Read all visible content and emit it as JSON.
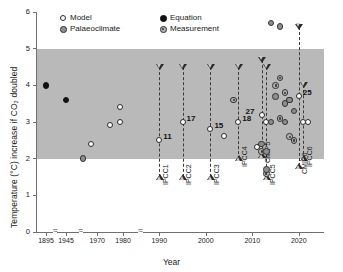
{
  "chart_data": {
    "type": "scatter",
    "title": "",
    "xlabel": "Year",
    "ylabel": "Temperature (°C) increase if CO₂ doubled",
    "ylim": [
      0,
      6
    ],
    "yticks": [
      0,
      1,
      2,
      3,
      4,
      5,
      6
    ],
    "xticks": [
      "1895",
      "1945",
      "1970",
      "1980",
      "1990",
      "2000",
      "2010",
      "2020"
    ],
    "axis_breaks": 3,
    "grid": false,
    "likely_range_band": {
      "low": 2.0,
      "high": 5.0,
      "label": ""
    },
    "legend": {
      "position": "top-left",
      "entries": [
        {
          "key": "model",
          "label": "Model"
        },
        {
          "key": "equation",
          "label": "Equation"
        },
        {
          "key": "palaeoclimate",
          "label": "Palaeoclimate"
        },
        {
          "key": "measurement",
          "label": "Measurement"
        }
      ]
    },
    "assessments": [
      {
        "name": "IPCC1",
        "year": 1990,
        "low": 1.5,
        "high": 4.5,
        "best": 2.5,
        "count": "11"
      },
      {
        "name": "IPCC2",
        "year": 1995,
        "low": 1.5,
        "high": 4.5,
        "best": 3.0,
        "count": "17"
      },
      {
        "name": "IPCC3",
        "year": 2001,
        "low": 1.5,
        "high": 4.5,
        "best": 2.8,
        "count": "15"
      },
      {
        "name": "IPCC4",
        "year": 2007,
        "low": 2.0,
        "high": 4.5,
        "best": 3.0,
        "count": "18"
      },
      {
        "name": "IPCC5",
        "year": 2013,
        "low": 1.5,
        "high": 4.5,
        "best": 3.0,
        "count": ""
      },
      {
        "name": "CMIP5",
        "year": 2012,
        "low": 2.1,
        "high": 4.7,
        "best": 3.2,
        "count": "27"
      },
      {
        "name": "IPCC6",
        "year": 2021,
        "low": 2.0,
        "high": 4.0,
        "best": 3.0,
        "count": ""
      },
      {
        "name": "CMIP6",
        "year": 2020,
        "low": 1.8,
        "high": 5.6,
        "best": 3.7,
        "count": "25"
      }
    ],
    "points": [
      {
        "type": "equation",
        "year": 1895,
        "value": 4.0
      },
      {
        "type": "equation",
        "year": 1945,
        "value": 3.6
      },
      {
        "type": "palaeoclimate",
        "year": 1960,
        "value": 2.0
      },
      {
        "type": "model",
        "year": 1967,
        "value": 2.4
      },
      {
        "type": "model",
        "year": 1975,
        "value": 2.9
      },
      {
        "type": "model",
        "year": 1979,
        "value": 3.0
      },
      {
        "type": "model",
        "year": 1979,
        "value": 3.4
      },
      {
        "type": "model",
        "year": 2004,
        "value": 2.6
      },
      {
        "type": "measurement",
        "year": 2006,
        "value": 3.6
      },
      {
        "type": "model",
        "year": 2011,
        "value": 2.3
      },
      {
        "type": "palaeoclimate",
        "year": 2012,
        "value": 2.4
      },
      {
        "type": "measurement",
        "year": 2012,
        "value": 2.2
      },
      {
        "type": "palaeoclimate",
        "year": 2013,
        "value": 2.2
      },
      {
        "type": "palaeoclimate",
        "year": 2014,
        "value": 5.7
      },
      {
        "type": "palaeoclimate",
        "year": 2016,
        "value": 5.6
      },
      {
        "type": "measurement",
        "year": 2015,
        "value": 4.0
      },
      {
        "type": "measurement",
        "year": 2016,
        "value": 4.2
      },
      {
        "type": "palaeoclimate",
        "year": 2015,
        "value": 3.7
      },
      {
        "type": "measurement",
        "year": 2017,
        "value": 3.8
      },
      {
        "type": "palaeoclimate",
        "year": 2017,
        "value": 3.5
      },
      {
        "type": "measurement",
        "year": 2018,
        "value": 3.6
      },
      {
        "type": "palaeoclimate",
        "year": 2018,
        "value": 3.6
      },
      {
        "type": "measurement",
        "year": 2016,
        "value": 3.1
      },
      {
        "type": "palaeoclimate",
        "year": 2017,
        "value": 3.0
      },
      {
        "type": "measurement",
        "year": 2018,
        "value": 2.6
      },
      {
        "type": "palaeoclimate",
        "year": 2019,
        "value": 3.3
      },
      {
        "type": "measurement",
        "year": 2019,
        "value": 2.5
      },
      {
        "type": "palaeoclimate",
        "year": 2014,
        "value": 3.0
      },
      {
        "type": "measurement",
        "year": 2013,
        "value": 1.6
      },
      {
        "type": "palaeoclimate",
        "year": 2013,
        "value": 1.7
      },
      {
        "type": "model",
        "year": 2022,
        "value": 3.0
      }
    ]
  }
}
